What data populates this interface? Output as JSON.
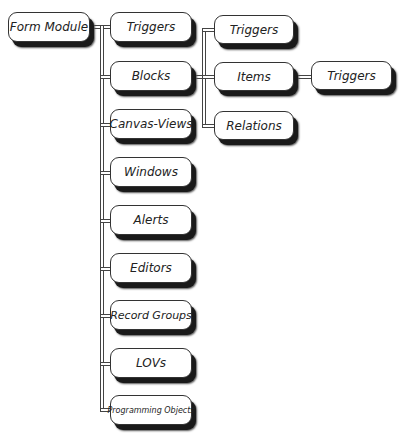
{
  "diagram": {
    "type": "tree",
    "root": {
      "label": "Form Module",
      "children": [
        {
          "label": "Triggers"
        },
        {
          "label": "Blocks",
          "children": [
            {
              "label": "Triggers"
            },
            {
              "label": "Items",
              "children": [
                {
                  "label": "Triggers"
                }
              ]
            },
            {
              "label": "Relations"
            }
          ]
        },
        {
          "label": "Canvas-Views"
        },
        {
          "label": "Windows"
        },
        {
          "label": "Alerts"
        },
        {
          "label": "Editors"
        },
        {
          "label": "Record Groups"
        },
        {
          "label": "LOVs"
        },
        {
          "label": "Programming Objects"
        }
      ]
    }
  },
  "colors": {
    "box_fill": "#ffffff",
    "box_border": "#333333",
    "shadow": "#1a1a1a",
    "connector": "#444444"
  }
}
